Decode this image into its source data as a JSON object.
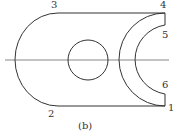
{
  "figure": {
    "caption": "(b)",
    "colors": {
      "stroke": "#333333",
      "background": "#ffffff"
    },
    "points": [
      {
        "id": "1",
        "label": "1"
      },
      {
        "id": "2",
        "label": "2"
      },
      {
        "id": "3",
        "label": "3"
      },
      {
        "id": "4",
        "label": "4"
      },
      {
        "id": "5",
        "label": "5"
      },
      {
        "id": "6",
        "label": "6"
      }
    ],
    "shapes": {
      "outline": "plate-outline",
      "hole": "circular-hole",
      "centerline": "horizontal-centerline"
    }
  }
}
